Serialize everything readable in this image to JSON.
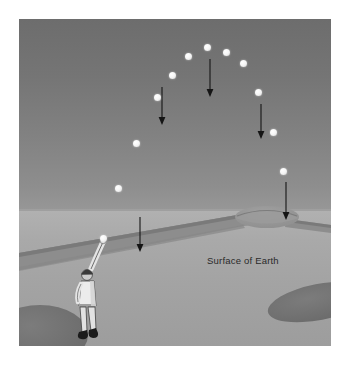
{
  "figure": {
    "caption_label": "Surface of Earth",
    "background_color": "#ffffff",
    "sky_color_top": "#6d6d6d",
    "sky_color_horizon": "#979797",
    "ground_color_near_horizon": "#b1b1b1",
    "ground_color_foreground": "#9d9d9d",
    "road_color": "#818181",
    "bush_color": "#6f6f6f",
    "ball_color": "#ffffff",
    "arrow_color": "#151515",
    "label_color": "#2a2a2a"
  },
  "scene": {
    "horizon_y": 191,
    "illustration_size": {
      "width": 312,
      "height": 327
    }
  },
  "thrower": {
    "name": "person-throwing-ball",
    "cap_color": "#3b3b3b",
    "shirt_color": "#e8e8e8",
    "pants_color": "#dcdcdc",
    "shoe_color": "#1c1c1c",
    "skin_color": "#cfcfcf"
  },
  "balls": [
    {
      "name": "ball-at-release",
      "x": 84,
      "y": 219,
      "label": "1"
    },
    {
      "name": "ball-rising-1",
      "x": 99,
      "y": 169,
      "label": "2"
    },
    {
      "name": "ball-rising-2",
      "x": 117,
      "y": 124,
      "label": "3"
    },
    {
      "name": "ball-rising-3",
      "x": 138,
      "y": 78,
      "label": "4"
    },
    {
      "name": "ball-rising-4",
      "x": 153,
      "y": 56,
      "label": "5"
    },
    {
      "name": "ball-near-apex-1",
      "x": 169,
      "y": 37,
      "label": "6"
    },
    {
      "name": "ball-apex",
      "x": 188,
      "y": 28,
      "label": "7"
    },
    {
      "name": "ball-near-apex-2",
      "x": 207,
      "y": 33,
      "label": "8"
    },
    {
      "name": "ball-falling-1",
      "x": 224,
      "y": 44,
      "label": "9"
    },
    {
      "name": "ball-falling-2",
      "x": 239,
      "y": 73,
      "label": "10"
    },
    {
      "name": "ball-falling-3",
      "x": 254,
      "y": 113,
      "label": "11"
    },
    {
      "name": "ball-falling-4",
      "x": 264,
      "y": 152,
      "label": "12"
    }
  ],
  "gravity_arrows": [
    {
      "name": "gravity-arrow-apex",
      "x": 191,
      "y1": 40,
      "y2": 78
    },
    {
      "name": "gravity-arrow-rising",
      "x": 143,
      "y1": 68,
      "y2": 106
    },
    {
      "name": "gravity-arrow-falling",
      "x": 242,
      "y1": 85,
      "y2": 120
    },
    {
      "name": "gravity-arrow-descending",
      "x": 267,
      "y1": 163,
      "y2": 201
    },
    {
      "name": "gravity-arrow-low",
      "x": 121,
      "y1": 198,
      "y2": 233
    }
  ],
  "landscape": {
    "road_name": "road-receding-to-horizon",
    "hill_name": "hill-on-horizon",
    "bush_left_name": "bush-foreground-left",
    "bush_right_name": "bush-foreground-right"
  }
}
